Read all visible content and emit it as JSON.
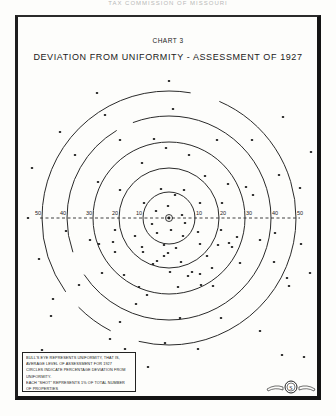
{
  "page_header": "TAX COMMISSION OF MISSOURI",
  "chart_data": {
    "type": "scatter",
    "chart_number": "CHART 3",
    "title": "DEVIATION FROM UNIFORMITY - ASSESSMENT OF 1927",
    "xlabel": "",
    "ylabel": "",
    "axis_ticks_left": [
      "50",
      "40",
      "30",
      "20",
      "10"
    ],
    "axis_ticks_right": [
      "10",
      "20",
      "30",
      "40",
      "50"
    ],
    "rings_percent": [
      10,
      20,
      30,
      40,
      50
    ],
    "grid": false,
    "legend_position": "bottom-left",
    "legend_lines": [
      "BULL'S EYE REPRESENTS UNIFORMITY, THAT IS,",
      "AVERAGE LEVEL OF ASSESSMENT FOR 1927",
      "CIRCLES INDICATE PERCENTAGE DEVIATION FROM",
      "UNIFORMITY.",
      "EACH \"SHOT\" REPRESENTS 1% OF TOTAL NUMBER",
      "OF PROPERTIES"
    ],
    "shots_count": 100,
    "shots_per_ring_approx": {
      "0-10": 24,
      "10-20": 20,
      "20-30": 17,
      "30-40": 14,
      "40-50": 11,
      "beyond_50": 14
    }
  },
  "geometry": {
    "center": [
      169,
      218
    ],
    "ring_radii": [
      26,
      50,
      76,
      102,
      127
    ],
    "shots": [
      [
        169,
        81
      ],
      [
        97,
        93
      ],
      [
        105,
        115
      ],
      [
        173,
        109
      ],
      [
        283,
        117
      ],
      [
        60,
        132
      ],
      [
        120,
        140
      ],
      [
        154,
        139
      ],
      [
        217,
        140
      ],
      [
        252,
        140
      ],
      [
        75,
        155
      ],
      [
        166,
        148
      ],
      [
        189,
        155
      ],
      [
        311,
        152
      ],
      [
        32,
        168
      ],
      [
        142,
        163
      ],
      [
        98,
        182
      ],
      [
        205,
        176
      ],
      [
        279,
        175
      ],
      [
        228,
        184
      ],
      [
        120,
        190
      ],
      [
        161,
        189
      ],
      [
        184,
        190
      ],
      [
        144,
        203
      ],
      [
        200,
        203
      ],
      [
        175,
        195
      ],
      [
        156,
        211
      ],
      [
        168,
        206
      ],
      [
        222,
        203
      ],
      [
        253,
        195
      ],
      [
        300,
        188
      ],
      [
        246,
        187
      ],
      [
        28,
        218
      ],
      [
        152,
        224
      ],
      [
        182,
        215
      ],
      [
        185,
        223
      ],
      [
        157,
        233
      ],
      [
        171,
        230
      ],
      [
        183,
        236
      ],
      [
        164,
        245
      ],
      [
        176,
        248
      ],
      [
        198,
        232
      ],
      [
        66,
        231
      ],
      [
        115,
        230
      ],
      [
        200,
        244
      ],
      [
        221,
        230
      ],
      [
        237,
        237
      ],
      [
        275,
        233
      ],
      [
        135,
        236
      ],
      [
        142,
        247
      ],
      [
        113,
        242
      ],
      [
        90,
        240
      ],
      [
        99,
        244
      ],
      [
        218,
        245
      ],
      [
        229,
        243
      ],
      [
        207,
        256
      ],
      [
        153,
        264
      ],
      [
        181,
        262
      ],
      [
        260,
        240
      ],
      [
        301,
        244
      ],
      [
        39,
        259
      ],
      [
        115,
        252
      ],
      [
        143,
        252
      ],
      [
        164,
        256
      ],
      [
        232,
        247
      ],
      [
        212,
        268
      ],
      [
        274,
        262
      ],
      [
        310,
        273
      ],
      [
        102,
        273
      ],
      [
        124,
        275
      ],
      [
        157,
        261
      ],
      [
        170,
        272
      ],
      [
        188,
        276
      ],
      [
        200,
        274
      ],
      [
        53,
        299
      ],
      [
        79,
        285
      ],
      [
        139,
        287
      ],
      [
        192,
        272
      ],
      [
        213,
        286
      ],
      [
        240,
        263
      ],
      [
        289,
        286
      ],
      [
        136,
        304
      ],
      [
        147,
        295
      ],
      [
        178,
        287
      ],
      [
        201,
        285
      ],
      [
        287,
        278
      ],
      [
        51,
        316
      ],
      [
        120,
        322
      ],
      [
        180,
        318
      ],
      [
        221,
        318
      ],
      [
        110,
        339
      ],
      [
        165,
        343
      ],
      [
        260,
        331
      ],
      [
        42,
        350
      ],
      [
        125,
        349
      ],
      [
        198,
        349
      ],
      [
        282,
        355
      ],
      [
        148,
        367
      ],
      [
        304,
        357
      ],
      [
        168,
        253
      ]
    ]
  }
}
